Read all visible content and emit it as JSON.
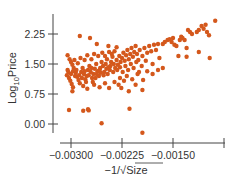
{
  "chart_data": {
    "type": "scatter",
    "title": "",
    "xlabel": "−1/√Size",
    "ylabel": "Log10Price",
    "ylabel_parts": {
      "base": "Log",
      "sub": "10",
      "rest": "Price"
    },
    "xlabel_parts": {
      "prefix": "−1/",
      "radical": "√",
      "under": "Size"
    },
    "xlim": [
      -0.00327,
      -0.0008
    ],
    "ylim": [
      -0.22,
      2.75
    ],
    "xticks": [
      -0.003,
      -0.00225,
      -0.0015,
      -0.00075
    ],
    "xtick_labels": [
      "−0.00300",
      "−0.00225",
      "−0.00150",
      ""
    ],
    "yticks": [
      0.0,
      0.75,
      1.5,
      2.25
    ],
    "ytick_labels": [
      "0.00",
      "0.75",
      "1.50",
      "2.25"
    ],
    "grid": false,
    "legend": null,
    "point_color": "#d4581c",
    "axis_color": "#444444",
    "series": [
      {
        "name": "houses",
        "points": [
          [
            -0.00303,
            0.35
          ],
          [
            -0.00282,
            0.33
          ],
          [
            -0.00275,
            0.37
          ],
          [
            -0.00274,
            0.34
          ],
          [
            -0.00255,
            0.02
          ],
          [
            -0.00214,
            0.38
          ],
          [
            -0.00195,
            -0.22
          ],
          [
            -0.00287,
            2.2
          ],
          [
            -0.00272,
            2.15
          ],
          [
            -0.00262,
            2.0
          ],
          [
            -0.00245,
            1.95
          ],
          [
            -0.00233,
            1.92
          ],
          [
            -0.00305,
            1.72
          ],
          [
            -0.00302,
            1.62
          ],
          [
            -0.003,
            1.55
          ],
          [
            -0.00298,
            1.48
          ],
          [
            -0.00296,
            1.4
          ],
          [
            -0.00304,
            1.3
          ],
          [
            -0.00306,
            1.22
          ],
          [
            -0.00303,
            1.15
          ],
          [
            -0.00301,
            1.08
          ],
          [
            -0.00299,
            1.0
          ],
          [
            -0.00297,
            0.92
          ],
          [
            -0.00305,
            1.35
          ],
          [
            -0.00293,
            1.28
          ],
          [
            -0.00291,
            1.18
          ],
          [
            -0.00289,
            1.1
          ],
          [
            -0.00287,
            1.02
          ],
          [
            -0.00285,
            1.3
          ],
          [
            -0.00283,
            1.4
          ],
          [
            -0.00281,
            1.25
          ],
          [
            -0.00279,
            1.12
          ],
          [
            -0.00277,
            1.2
          ],
          [
            -0.00275,
            1.35
          ],
          [
            -0.00273,
            1.45
          ],
          [
            -0.00271,
            1.3
          ],
          [
            -0.00269,
            1.15
          ],
          [
            -0.00267,
            1.25
          ],
          [
            -0.00265,
            1.38
          ],
          [
            -0.00263,
            1.5
          ],
          [
            -0.00261,
            1.32
          ],
          [
            -0.00259,
            1.2
          ],
          [
            -0.00257,
            1.4
          ],
          [
            -0.00255,
            1.55
          ],
          [
            -0.00253,
            1.45
          ],
          [
            -0.00251,
            1.3
          ],
          [
            -0.00249,
            1.5
          ],
          [
            -0.00247,
            1.62
          ],
          [
            -0.00245,
            1.42
          ],
          [
            -0.00243,
            1.35
          ],
          [
            -0.00241,
            1.55
          ],
          [
            -0.00239,
            1.68
          ],
          [
            -0.00237,
            1.5
          ],
          [
            -0.00235,
            1.4
          ],
          [
            -0.00295,
            1.6
          ],
          [
            -0.0029,
            1.52
          ],
          [
            -0.00286,
            1.65
          ],
          [
            -0.0028,
            1.6
          ],
          [
            -0.00276,
            1.72
          ],
          [
            -0.0027,
            1.62
          ],
          [
            -0.00266,
            1.75
          ],
          [
            -0.0026,
            1.7
          ],
          [
            -0.00254,
            1.78
          ],
          [
            -0.0025,
            1.7
          ],
          [
            -0.00244,
            1.8
          ],
          [
            -0.0024,
            1.75
          ],
          [
            -0.00236,
            1.82
          ],
          [
            -0.003,
            1.25
          ],
          [
            -0.00297,
            1.32
          ],
          [
            -0.00294,
            1.2
          ],
          [
            -0.00292,
            1.35
          ],
          [
            -0.00288,
            1.22
          ],
          [
            -0.00284,
            1.15
          ],
          [
            -0.0028,
            1.32
          ],
          [
            -0.00278,
            1.05
          ],
          [
            -0.00274,
            1.22
          ],
          [
            -0.0027,
            1.4
          ],
          [
            -0.00268,
            1.05
          ],
          [
            -0.00264,
            1.15
          ],
          [
            -0.00262,
            1.25
          ],
          [
            -0.00258,
            1.35
          ],
          [
            -0.00256,
            1.28
          ],
          [
            -0.00252,
            1.22
          ],
          [
            -0.00248,
            1.38
          ],
          [
            -0.00246,
            1.25
          ],
          [
            -0.00242,
            1.45
          ],
          [
            -0.00238,
            1.3
          ],
          [
            -0.00298,
            0.82
          ],
          [
            -0.00282,
            0.95
          ],
          [
            -0.00276,
            0.88
          ],
          [
            -0.00266,
            0.98
          ],
          [
            -0.00258,
            0.92
          ],
          [
            -0.0025,
            1.02
          ],
          [
            -0.00244,
            0.9
          ],
          [
            -0.00236,
            1.05
          ],
          [
            -0.0023,
            0.98
          ],
          [
            -0.00233,
            1.6
          ],
          [
            -0.00231,
            1.48
          ],
          [
            -0.00229,
            1.7
          ],
          [
            -0.00227,
            1.55
          ],
          [
            -0.00225,
            1.65
          ],
          [
            -0.00223,
            1.78
          ],
          [
            -0.00221,
            1.58
          ],
          [
            -0.00219,
            1.72
          ],
          [
            -0.00217,
            1.85
          ],
          [
            -0.00215,
            1.62
          ],
          [
            -0.00213,
            1.75
          ],
          [
            -0.00211,
            1.9
          ],
          [
            -0.00209,
            1.68
          ],
          [
            -0.00207,
            1.8
          ],
          [
            -0.00205,
            1.95
          ],
          [
            -0.00203,
            1.75
          ],
          [
            -0.00201,
            1.6
          ],
          [
            -0.00232,
            1.35
          ],
          [
            -0.00228,
            1.42
          ],
          [
            -0.00224,
            1.3
          ],
          [
            -0.0022,
            1.45
          ],
          [
            -0.00216,
            1.35
          ],
          [
            -0.00212,
            1.5
          ],
          [
            -0.00208,
            1.4
          ],
          [
            -0.00204,
            1.55
          ],
          [
            -0.002,
            1.3
          ],
          [
            -0.00196,
            1.45
          ],
          [
            -0.00228,
            1.15
          ],
          [
            -0.00222,
            1.08
          ],
          [
            -0.00218,
            1.2
          ],
          [
            -0.0021,
            1.12
          ],
          [
            -0.00202,
            1.25
          ],
          [
            -0.00194,
            1.1
          ],
          [
            -0.00188,
            1.32
          ],
          [
            -0.00226,
            0.9
          ],
          [
            -0.00215,
            0.82
          ],
          [
            -0.00205,
            0.98
          ],
          [
            -0.00195,
            0.85
          ],
          [
            -0.00199,
            1.85
          ],
          [
            -0.00195,
            1.7
          ],
          [
            -0.00192,
            1.9
          ],
          [
            -0.00188,
            1.78
          ],
          [
            -0.00185,
            1.95
          ],
          [
            -0.00182,
            1.82
          ],
          [
            -0.00178,
            1.98
          ],
          [
            -0.00175,
            1.85
          ],
          [
            -0.00172,
            2.0
          ],
          [
            -0.0019,
            1.58
          ],
          [
            -0.0018,
            1.5
          ],
          [
            -0.0017,
            1.65
          ],
          [
            -0.00165,
            2.0
          ],
          [
            -0.00162,
            2.05
          ],
          [
            -0.00158,
            2.1
          ],
          [
            -0.00155,
            2.12
          ],
          [
            -0.00152,
            2.05
          ],
          [
            -0.0015,
            2.15
          ],
          [
            -0.0014,
            2.1
          ],
          [
            -0.00138,
            2.18
          ],
          [
            -0.00136,
            2.15
          ],
          [
            -0.00133,
            2.1
          ],
          [
            -0.00128,
            2.35
          ],
          [
            -0.00125,
            2.3
          ],
          [
            -0.00122,
            2.25
          ],
          [
            -0.00115,
            2.3
          ],
          [
            -0.00112,
            2.35
          ],
          [
            -0.00108,
            2.45
          ],
          [
            -0.00105,
            2.38
          ],
          [
            -0.00102,
            2.48
          ],
          [
            -0.001,
            2.3
          ],
          [
            -0.00097,
            2.22
          ],
          [
            -0.00088,
            2.58
          ],
          [
            -0.00148,
            1.98
          ],
          [
            -0.00145,
            1.95
          ],
          [
            -0.0013,
            1.9
          ],
          [
            -0.00142,
            1.7
          ],
          [
            -0.0013,
            1.68
          ],
          [
            -0.00112,
            1.8
          ],
          [
            -0.00096,
            1.65
          ],
          [
            -0.0018,
            1.25
          ],
          [
            -0.00172,
            1.35
          ],
          [
            -0.00165,
            1.4
          ]
        ]
      }
    ]
  }
}
